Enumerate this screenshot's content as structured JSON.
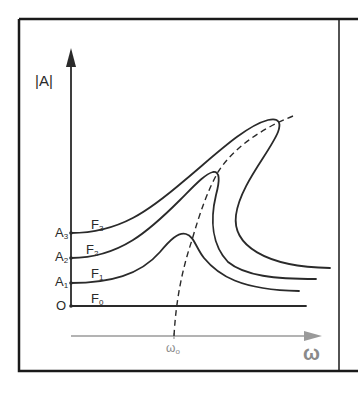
{
  "diagram": {
    "type": "frequency-response-curves",
    "y_axis_label": "|A|",
    "x_axis_label": "ω",
    "resonance_label": "ω",
    "resonance_subscript": "o",
    "origin_label": "O",
    "amplitude_levels": [
      {
        "base": "A",
        "sub": "1"
      },
      {
        "base": "A",
        "sub": "2"
      },
      {
        "base": "A",
        "sub": "3"
      }
    ],
    "curves": [
      {
        "base": "F",
        "sub": "0",
        "description": "flat baseline"
      },
      {
        "base": "F",
        "sub": "1",
        "description": "small peak near ω0"
      },
      {
        "base": "F",
        "sub": "2",
        "description": "bent peak leaning right"
      },
      {
        "base": "F",
        "sub": "3",
        "description": "strongly bent peak leaning right"
      }
    ],
    "backbone": "dashed curve through peaks",
    "colors": {
      "ink": "#2a2a2a",
      "x_axis": "#9a9a9a",
      "frame": "#1a1a1a"
    }
  }
}
